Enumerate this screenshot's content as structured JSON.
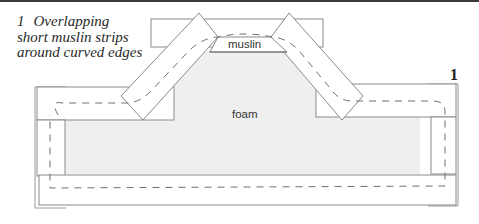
{
  "figure": {
    "number": "1",
    "caption_number": "1",
    "caption_text": "Overlapping short muslin strips around curved edges",
    "caption_lines": [
      "Overlapping",
      "short muslin strips",
      "around curved edges"
    ]
  },
  "labels": {
    "muslin": "muslin",
    "foam": "foam"
  },
  "colors": {
    "foam_fill": "#efefef",
    "line": "#8a8a8a",
    "dashed_line": "#6f6f6f",
    "header_rule": "#3a3a3a"
  }
}
